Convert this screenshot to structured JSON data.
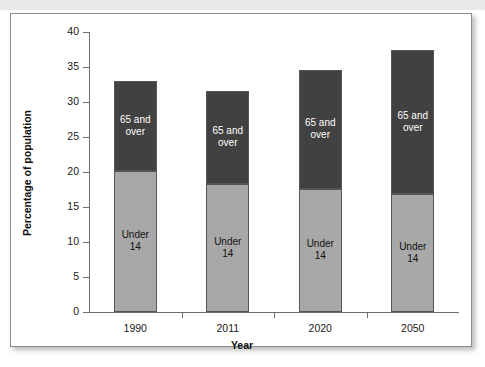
{
  "top_crop_text": "g g  g  p   p    p",
  "chart_data": {
    "type": "bar",
    "stacked": true,
    "title": "",
    "xlabel": "Year",
    "ylabel": "Percentage of population",
    "categories": [
      "1990",
      "2011",
      "2020",
      "2050"
    ],
    "ylim": [
      0,
      40
    ],
    "yticks": [
      0,
      5,
      10,
      15,
      20,
      25,
      30,
      35,
      40
    ],
    "ytick_labels": [
      "0",
      "5",
      "10",
      "15",
      "20",
      "25",
      "30",
      "35",
      "40"
    ],
    "grid": false,
    "legend": "none (series labelled inside bars)",
    "series": [
      {
        "name": "Under 14",
        "label_line1": "Under",
        "label_line2": "14",
        "color": "#a8a8a8",
        "text_color": "#111111",
        "values": [
          20.2,
          18.3,
          17.6,
          16.8
        ]
      },
      {
        "name": "65 and over",
        "label_line1": "65 and",
        "label_line2": "over",
        "color": "#414141",
        "text_color": "#ffffff",
        "values": [
          12.8,
          13.3,
          17.0,
          20.7
        ]
      }
    ],
    "totals": [
      33.0,
      31.6,
      34.6,
      37.5
    ]
  }
}
